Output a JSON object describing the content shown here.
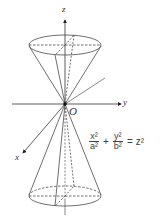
{
  "diagram": {
    "axes": {
      "z_label": "z",
      "y_label": "y",
      "x_label": "x",
      "origin_label": "O"
    },
    "equation": {
      "term1_num": "x²",
      "term1_den": "a²",
      "plus": "+",
      "term2_num": "y²",
      "term2_den": "b²",
      "equals": "=",
      "rhs": "z²"
    },
    "caption": ""
  },
  "colors": {
    "line": "#4a4a4a",
    "dashed": "#6a6a6a",
    "background": "#ffffff"
  }
}
